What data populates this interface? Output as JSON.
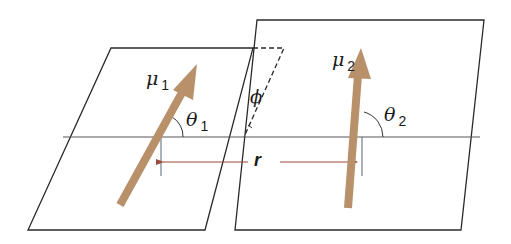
{
  "figure": {
    "type": "dipole-dipole orientation diagram",
    "colors": {
      "plane_stroke": "#2a2a2a",
      "axis_line": "#555555",
      "dipole_arrow": "#b8906a",
      "distance_arrow": "#9c4a3a",
      "tick_line": "#556677"
    },
    "dipoles": [
      {
        "symbol": "μ",
        "index": "1",
        "angle_symbol": "θ",
        "angle_index": "1"
      },
      {
        "symbol": "μ",
        "index": "2",
        "angle_symbol": "θ",
        "angle_index": "2"
      }
    ],
    "distance_label": "r",
    "plane_angle_label": "ϕ"
  }
}
